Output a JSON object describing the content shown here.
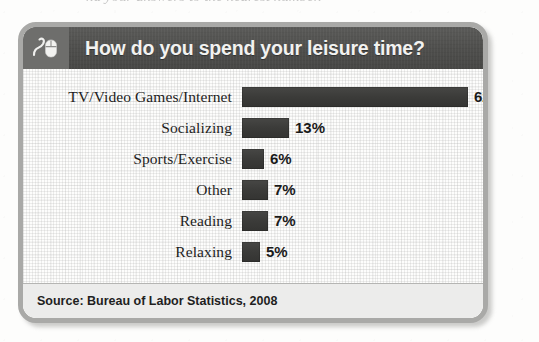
{
  "page": {
    "cutoff_line": "nd your answers to the nearest number."
  },
  "card": {
    "header": {
      "icon": "computer-mouse-icon",
      "title": "How do you spend your leisure time?"
    },
    "footer": {
      "source": "Source: Bureau of Labor Statistics, 2008"
    }
  },
  "chart_data": {
    "type": "bar",
    "orientation": "horizontal",
    "title": "How do you spend your leisure time?",
    "xlabel": "",
    "ylabel": "",
    "xlim": [
      0,
      62
    ],
    "grid": true,
    "legend": "none",
    "source": "Bureau of Labor Statistics, 2008",
    "bar_color": "#3b3b39",
    "categories": [
      "TV/Video Games/Internet",
      "Socializing",
      "Sports/Exercise",
      "Other",
      "Reading",
      "Relaxing"
    ],
    "values": [
      62,
      13,
      6,
      7,
      7,
      5
    ],
    "value_labels": [
      "62%",
      "13%",
      "6%",
      "7%",
      "7%",
      "5%"
    ]
  }
}
